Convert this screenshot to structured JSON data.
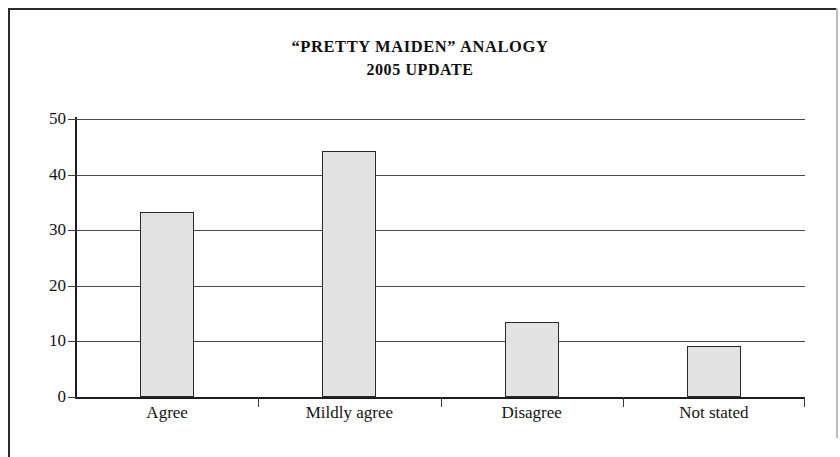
{
  "document": {
    "frame_color": "#2b2b2b"
  },
  "chart_data": {
    "type": "bar",
    "title": "“PRETTY MAIDEN” ANALOGY",
    "subtitle": "2005 UPDATE",
    "title_line1": "“PRETTY MAIDEN” ANALOGY",
    "title_line2": "2005 UPDATE",
    "categories": [
      "Agree",
      "Mildly agree",
      "Disagree",
      "Not stated"
    ],
    "values": [
      33.2,
      44.2,
      13.4,
      9.1
    ],
    "xlabel": "",
    "ylabel": "",
    "ylim": [
      0,
      50
    ],
    "yticks": [
      0,
      10,
      20,
      30,
      40,
      50
    ],
    "ytick_labels": [
      "0",
      "10",
      "20",
      "30",
      "40",
      "50"
    ],
    "grid": true,
    "legend": false,
    "bar_fill": "#e2e2e2",
    "bar_edge": "#2a2a2a"
  }
}
